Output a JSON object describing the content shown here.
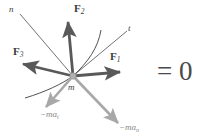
{
  "figure": {
    "type": "free-body-diagram",
    "background_color": "#ffffff",
    "colors": {
      "force_arrow": "#595959",
      "inertia_arrow": "#a8a8a8",
      "axis_line": "#4d4d4d",
      "curve_line": "#3d3d3d",
      "text": "#3b3b3b",
      "equation_text": "#4a4a4a",
      "particle_fill": "#b0b0b0"
    },
    "origin": {
      "x": 73,
      "y": 76,
      "label": "m"
    },
    "equation": "= 0",
    "vectors": [
      {
        "name": "F1",
        "label_main": "F",
        "label_sub": "1",
        "style": "force",
        "tip": {
          "x": 125,
          "y": 72
        },
        "label_pos": {
          "x": 110,
          "y": 53
        }
      },
      {
        "name": "F2",
        "label_main": "F",
        "label_sub": "2",
        "style": "force",
        "tip": {
          "x": 68,
          "y": 17
        },
        "label_pos": {
          "x": 73,
          "y": 6
        }
      },
      {
        "name": "F3",
        "label_main": "F",
        "label_sub": "3",
        "style": "force",
        "tip": {
          "x": 18,
          "y": 63
        },
        "label_pos": {
          "x": 14,
          "y": 47
        }
      },
      {
        "name": "minus-m-a-t",
        "label_main": "−ma",
        "label_sub": "t",
        "style": "inertia",
        "tip": {
          "x": 43,
          "y": 110
        },
        "label_pos": {
          "x": 41,
          "y": 112
        }
      },
      {
        "name": "minus-m-a-n",
        "label_main": "−ma",
        "label_sub": "n",
        "style": "inertia",
        "tip": {
          "x": 122,
          "y": 127
        },
        "label_pos": {
          "x": 119,
          "y": 124
        }
      }
    ],
    "axes": [
      {
        "name": "n-axis",
        "label": "n",
        "from": {
          "x": 20,
          "y": 14
        },
        "to": {
          "x": 73,
          "y": 76
        },
        "label_pos": {
          "x": 10,
          "y": 7
        }
      },
      {
        "name": "t-axis",
        "label": "t",
        "from": {
          "x": 73,
          "y": 76
        },
        "to": {
          "x": 127,
          "y": 31
        },
        "label_pos": {
          "x": 129,
          "y": 26
        }
      }
    ],
    "curves": [
      {
        "name": "path-curve-lower",
        "path": "M 25 98 C 45 92 62 84 73 76"
      },
      {
        "name": "path-curve-upper",
        "path": "M 73 76 C 88 62 98 48 101 30"
      }
    ]
  }
}
